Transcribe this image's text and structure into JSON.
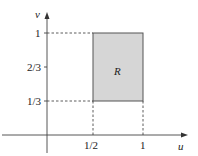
{
  "diagram": {
    "axes": {
      "x_label": "u",
      "y_label": "v",
      "x_ticks": [
        {
          "label": "1/2",
          "value": 0.5
        },
        {
          "label": "1",
          "value": 1
        }
      ],
      "y_ticks": [
        {
          "label": "1/3",
          "value": 0.3333
        },
        {
          "label": "2/3",
          "value": 0.6667
        },
        {
          "label": "1",
          "value": 1
        }
      ]
    },
    "region": {
      "label": "R",
      "u_range": [
        0.5,
        1
      ],
      "v_range": [
        0.3333,
        1
      ],
      "fill_color": "#d6d6d6",
      "stroke_color": "#555555"
    }
  }
}
